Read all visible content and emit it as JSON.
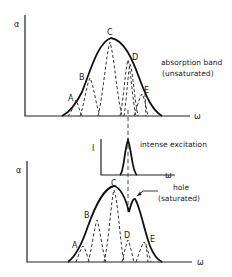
{
  "figure": {
    "top_panel": {
      "y_axis_label": "α",
      "x_axis_label": "ω",
      "title_line1": "absorption band",
      "title_line2": "(unsaturated)",
      "peak_labels": [
        "A",
        "B",
        "C",
        "D",
        "E"
      ]
    },
    "excitation_panel": {
      "y_axis_label": "I",
      "x_axis_label": "ω",
      "title": "intense excitation"
    },
    "bottom_panel": {
      "y_axis_label": "α",
      "x_axis_label": "ω",
      "hole_label_line1": "hole",
      "hole_label_line2": "(saturated)",
      "peak_labels": [
        "A",
        "B",
        "C",
        "D",
        "E"
      ]
    }
  }
}
